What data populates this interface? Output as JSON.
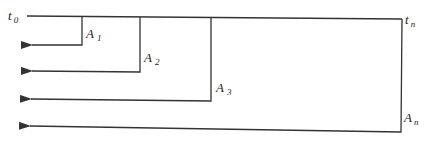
{
  "diagram": {
    "type": "timeline-branch",
    "line_color": "#333333",
    "timeline": {
      "start_label": {
        "main": "t",
        "sub": "0"
      },
      "end_label": {
        "main": "t",
        "sub": "n"
      }
    },
    "branches": [
      {
        "label": {
          "main": "A",
          "sub": "1"
        }
      },
      {
        "label": {
          "main": "A",
          "sub": "2"
        }
      },
      {
        "label": {
          "main": "A",
          "sub": "3"
        }
      },
      {
        "label": {
          "main": "A",
          "sub": "n"
        }
      }
    ]
  }
}
